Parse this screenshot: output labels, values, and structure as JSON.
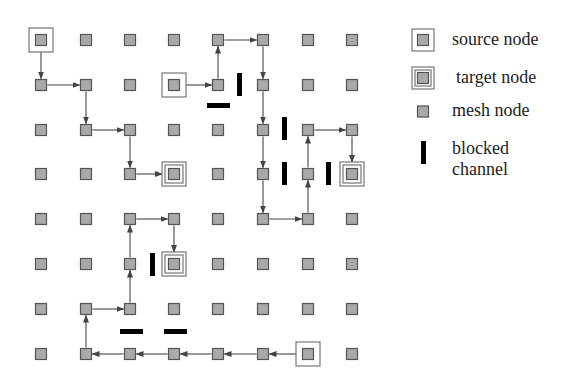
{
  "diagram": {
    "grid": {
      "cols": 8,
      "rows": 8,
      "x": [
        41,
        86,
        130,
        174,
        218,
        263,
        308,
        352
      ],
      "y": [
        40,
        85,
        130,
        174,
        219,
        264,
        309,
        354
      ],
      "node_size": 11
    },
    "colors": {
      "node_fill": "#a9a9a9",
      "node_border": "#555555",
      "frame": "#777777",
      "arrow": "#444444",
      "blocked": "#000000"
    },
    "sources": [
      [
        0,
        0
      ],
      [
        3,
        1
      ],
      [
        6,
        7
      ]
    ],
    "targets": [
      [
        3,
        3
      ],
      [
        7,
        3
      ],
      [
        3,
        5
      ]
    ],
    "paths": [
      {
        "name": "path-1",
        "nodes": [
          [
            0,
            0
          ],
          [
            0,
            1
          ],
          [
            1,
            1
          ],
          [
            1,
            2
          ],
          [
            2,
            2
          ],
          [
            2,
            3
          ],
          [
            3,
            3
          ]
        ]
      },
      {
        "name": "path-2",
        "nodes": [
          [
            3,
            1
          ],
          [
            4,
            1
          ],
          [
            4,
            0
          ],
          [
            5,
            0
          ],
          [
            5,
            1
          ],
          [
            5,
            2
          ],
          [
            5,
            3
          ],
          [
            5,
            4
          ],
          [
            6,
            4
          ],
          [
            6,
            3
          ],
          [
            6,
            2
          ],
          [
            7,
            2
          ],
          [
            7,
            3
          ]
        ]
      },
      {
        "name": "path-3",
        "nodes": [
          [
            6,
            7
          ],
          [
            5,
            7
          ],
          [
            4,
            7
          ],
          [
            3,
            7
          ],
          [
            2,
            7
          ],
          [
            1,
            7
          ],
          [
            1,
            6
          ],
          [
            2,
            6
          ],
          [
            2,
            5
          ],
          [
            2,
            4
          ],
          [
            3,
            4
          ],
          [
            3,
            5
          ]
        ]
      }
    ],
    "blocked_channels": [
      {
        "x": 237,
        "y": 73,
        "w": 5,
        "h": 23
      },
      {
        "x": 207,
        "y": 103,
        "w": 23,
        "h": 5
      },
      {
        "x": 282,
        "y": 117,
        "w": 5,
        "h": 23
      },
      {
        "x": 282,
        "y": 162,
        "w": 5,
        "h": 23
      },
      {
        "x": 326,
        "y": 162,
        "w": 5,
        "h": 23
      },
      {
        "x": 150,
        "y": 253,
        "w": 5,
        "h": 23
      },
      {
        "x": 120,
        "y": 329,
        "w": 23,
        "h": 5
      },
      {
        "x": 164,
        "y": 329,
        "w": 23,
        "h": 5
      }
    ]
  },
  "legend": {
    "items": [
      {
        "icon": "source-node-icon",
        "label": "source node"
      },
      {
        "icon": "target-node-icon",
        "label": "target node"
      },
      {
        "icon": "mesh-node-icon",
        "label": "mesh node"
      },
      {
        "icon": "blocked-channel-icon",
        "label_line1": "blocked",
        "label_line2": "channel"
      }
    ]
  }
}
